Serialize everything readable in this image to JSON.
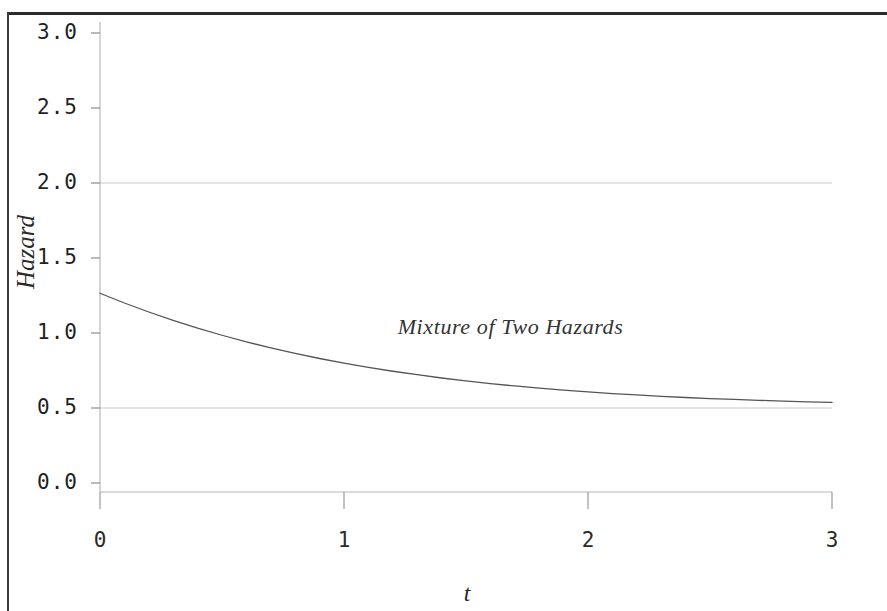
{
  "chart_data": {
    "type": "line",
    "title": "",
    "xlabel": "t",
    "ylabel": "Hazard",
    "xlim": [
      0,
      3
    ],
    "ylim": [
      0.0,
      3.0
    ],
    "grid": true,
    "grid_lines_y": [
      0.5,
      2.0
    ],
    "legend_position": "none",
    "x_ticks": [
      0,
      1,
      2,
      3
    ],
    "x_tick_labels": [
      "0",
      "1",
      "2",
      "3"
    ],
    "y_ticks": [
      0.0,
      0.5,
      1.0,
      1.5,
      2.0,
      2.5,
      3.0
    ],
    "y_tick_labels": [
      "0.0",
      "0.5",
      "1.0",
      "1.5",
      "2.0",
      "2.5",
      "3.0"
    ],
    "annotations": [
      {
        "text": "Mixture of Two Hazards",
        "x": 1.22,
        "y": 1.05
      }
    ],
    "series": [
      {
        "name": "Mixture of Two Hazards",
        "color": "#555555",
        "x": [
          0.0,
          0.1,
          0.2,
          0.3,
          0.4,
          0.5,
          0.6,
          0.7,
          0.8,
          0.9,
          1.0,
          1.1,
          1.2,
          1.3,
          1.4,
          1.5,
          1.6,
          1.7,
          1.8,
          1.9,
          2.0,
          2.1,
          2.2,
          2.3,
          2.4,
          2.5,
          2.6,
          2.7,
          2.8,
          2.9,
          3.0
        ],
        "values": [
          1.265,
          1.2,
          1.14,
          1.084,
          1.032,
          0.985,
          0.941,
          0.901,
          0.864,
          0.83,
          0.799,
          0.771,
          0.745,
          0.722,
          0.7,
          0.681,
          0.663,
          0.647,
          0.632,
          0.619,
          0.607,
          0.596,
          0.587,
          0.578,
          0.57,
          0.563,
          0.557,
          0.551,
          0.546,
          0.541,
          0.537
        ]
      }
    ]
  },
  "axis_labels": {
    "y": "Hazard",
    "x": "t"
  },
  "annotation_label": "Mixture of Two Hazards"
}
